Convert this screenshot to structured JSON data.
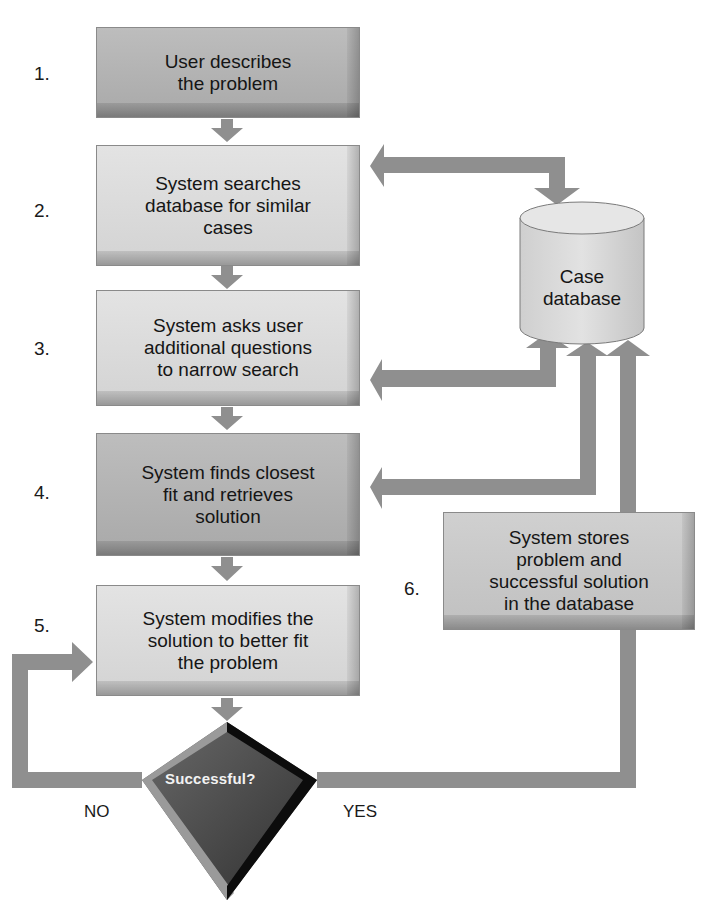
{
  "diagram": {
    "type": "flowchart",
    "colors": {
      "arrow": "#8f8f8f",
      "box_dark": "#b4b4b4",
      "box_light": "#dcdcdc",
      "diamond": "#4a4a4a",
      "background": "#ffffff"
    },
    "steps": [
      {
        "number": "1.",
        "text": "User describes\nthe problem",
        "shade": "dark"
      },
      {
        "number": "2.",
        "text": "System searches\ndatabase for similar\ncases",
        "shade": "light"
      },
      {
        "number": "3.",
        "text": "System asks user\nadditional questions\nto narrow search",
        "shade": "light"
      },
      {
        "number": "4.",
        "text": "System finds closest\nfit and retrieves\nsolution",
        "shade": "dark"
      },
      {
        "number": "5.",
        "text": "System modifies the\nsolution to better fit\nthe problem",
        "shade": "light"
      },
      {
        "number": "6.",
        "text": "System stores\nproblem and\nsuccessful solution\nin the database",
        "shade": "mid"
      }
    ],
    "database": {
      "label": "Case\ndatabase"
    },
    "decision": {
      "label": "Successful?",
      "no_label": "NO",
      "yes_label": "YES"
    }
  }
}
